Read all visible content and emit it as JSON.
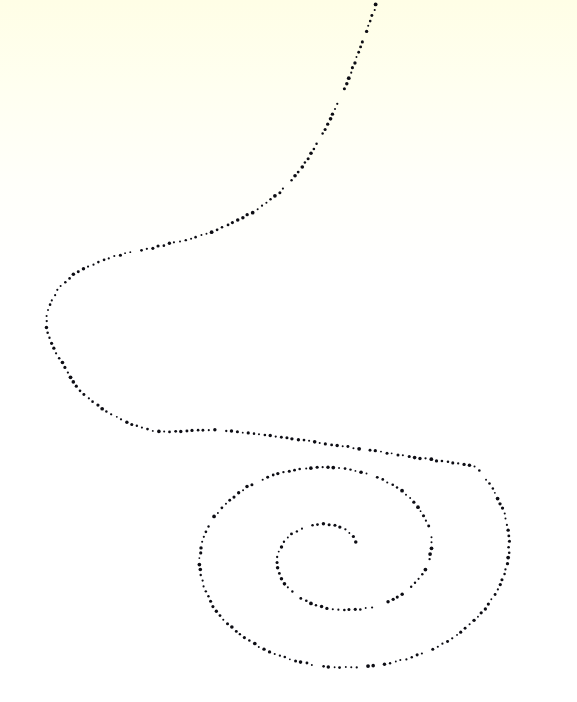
{
  "figure": {
    "title": "Dotted spiral with trailing S-curve",
    "kind": "stippled-line-drawing",
    "width": 577,
    "height": 702,
    "background": {
      "base_color": "#ffffff",
      "tint_color": "#ffffe8",
      "tint_description": "pale cream wash strongest at the top edge, fading to white below roughly y=170",
      "gradient_stops": [
        {
          "offset": "0%",
          "color": "#fffee6"
        },
        {
          "offset": "12%",
          "color": "#fffff0"
        },
        {
          "offset": "26%",
          "color": "#fffffa"
        },
        {
          "offset": "40%",
          "color": "#ffffff"
        },
        {
          "offset": "100%",
          "color": "#ffffff"
        }
      ]
    },
    "stroke": {
      "style": "dotted",
      "dot_color": "#0d0d14",
      "dot_radius_min": 0.9,
      "dot_radius_max": 1.9,
      "dot_spacing_px": 5.6,
      "jitter_px": 0.55,
      "missing_dot_probability": 0.07
    }
  },
  "chart_data": {
    "type": "line",
    "title": "Dotted spiral with trailing S-curve",
    "xlabel": "",
    "ylabel": "",
    "grid": false,
    "legend": "none",
    "axis_visible": false,
    "xlim": [
      0,
      577
    ],
    "ylim": [
      0,
      702
    ],
    "coordinate_note": "pixel coordinates, y increases downward",
    "spiral": {
      "description": "Archimedean spiral traced outward counterclockwise from an inner endpoint, with vertical flattening, then continuing into an open S tail that leaves the top of the frame",
      "center_x": 335,
      "center_y": 553,
      "y_squash": 0.74,
      "theta_start_deg": 20,
      "theta_end_deg": 760,
      "r_start": 22,
      "r_growth_per_turn": 78,
      "inner_endpoint": [
        355,
        557
      ],
      "outer_extremes": {
        "leftmost": [
          62,
          578
        ],
        "rightmost": [
          537,
          540
        ],
        "topmost": [
          213,
          479
        ],
        "bottommost": [
          330,
          666
        ]
      }
    },
    "tail": {
      "description": "After the outermost spiral turn the curve sweeps left along y≈440, loops around a left cusp near x=37,y=325, climbs back right and exits the top edge at x≈378",
      "control_points": [
        [
          240,
          432
        ],
        [
          150,
          430
        ],
        [
          88,
          398
        ],
        [
          62,
          362
        ],
        [
          47,
          330
        ],
        [
          52,
          300
        ],
        [
          72,
          276
        ],
        [
          110,
          258
        ],
        [
          160,
          246
        ],
        [
          214,
          231
        ],
        [
          262,
          206
        ],
        [
          296,
          175
        ],
        [
          320,
          138
        ],
        [
          342,
          95
        ],
        [
          360,
          48
        ],
        [
          378,
          0
        ]
      ],
      "exit_point_top": [
        378,
        0
      ],
      "left_cusp": [
        37,
        325
      ]
    },
    "series": [
      {
        "name": "spiral-path",
        "point_count_estimate": 520,
        "closed": false
      }
    ]
  }
}
